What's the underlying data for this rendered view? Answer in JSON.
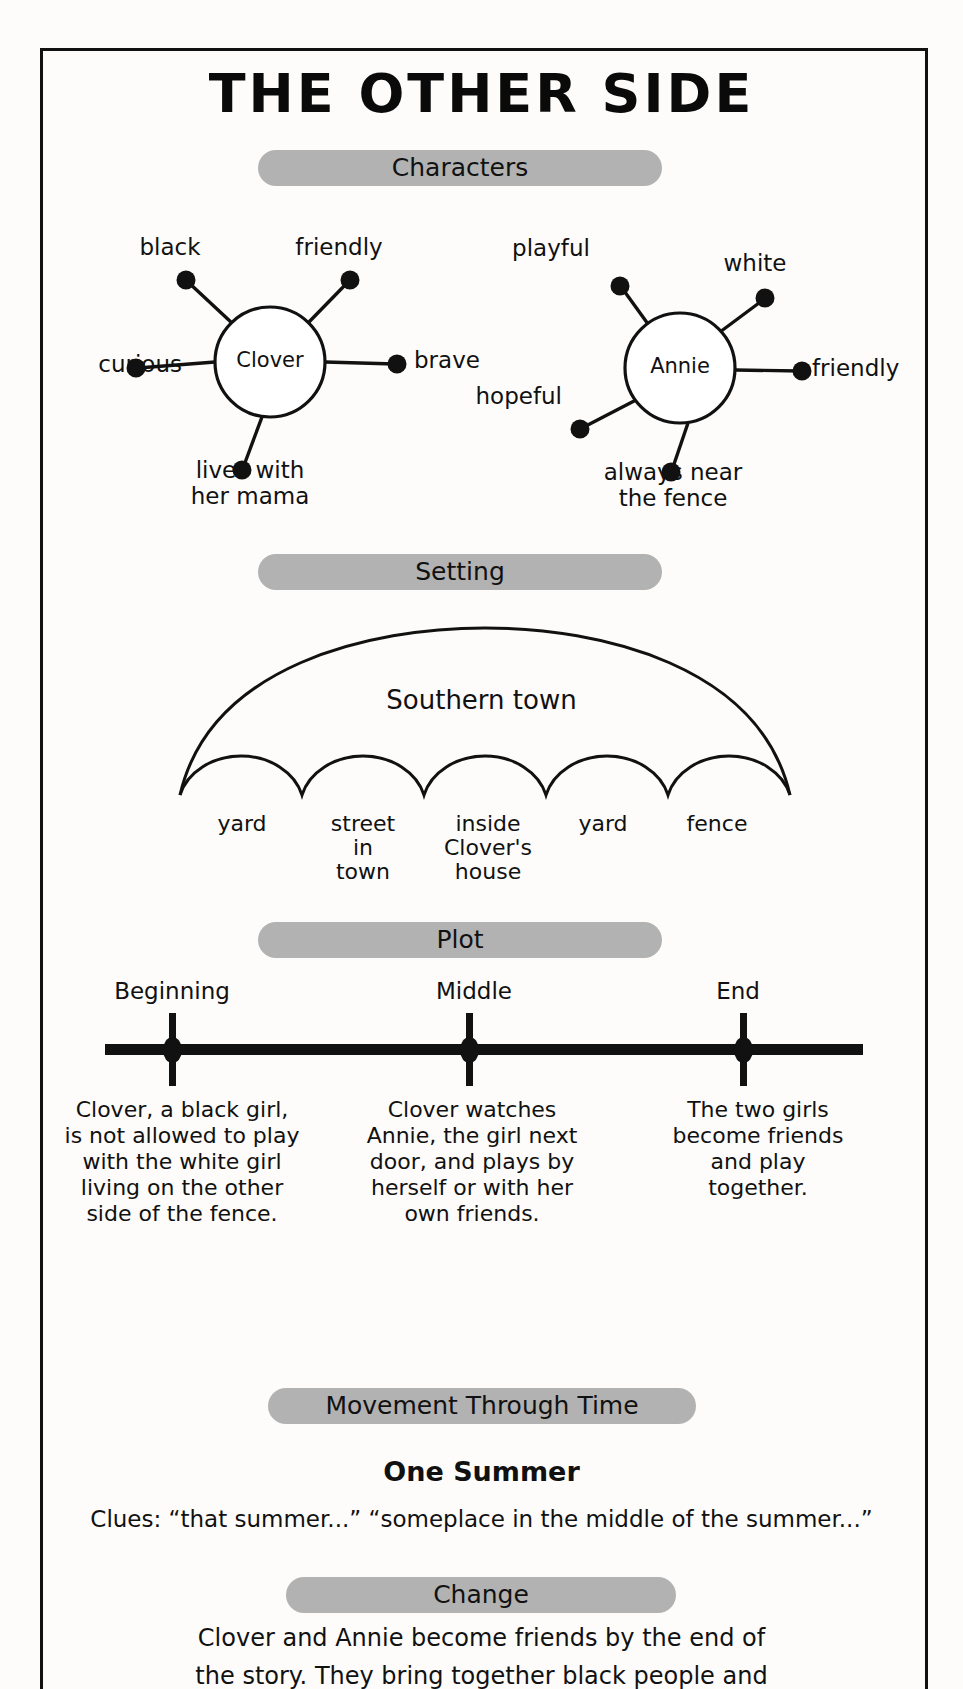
{
  "title": "THE OTHER SIDE",
  "sections": {
    "characters": {
      "banner": "Characters"
    },
    "setting": {
      "banner": "Setting"
    },
    "plot": {
      "banner": "Plot"
    },
    "movement": {
      "banner": "Movement Through Time"
    },
    "change": {
      "banner": "Change"
    }
  },
  "characters": [
    {
      "name": "Clover",
      "traits": [
        {
          "label": "black"
        },
        {
          "label": "friendly"
        },
        {
          "label": "curious"
        },
        {
          "label": "brave"
        },
        {
          "label": "lives with\nher mama"
        }
      ]
    },
    {
      "name": "Annie",
      "traits": [
        {
          "label": "playful"
        },
        {
          "label": "white"
        },
        {
          "label": "hopeful"
        },
        {
          "label": "friendly"
        },
        {
          "label": "always near\nthe fence"
        }
      ]
    }
  ],
  "setting": {
    "main": "Southern town",
    "places": [
      "yard",
      "street\nin\ntown",
      "inside\nClover's\nhouse",
      "yard",
      "fence"
    ]
  },
  "plot": {
    "stages": [
      {
        "label": "Beginning",
        "description": "Clover, a black girl,\nis not allowed to play\nwith the white girl\nliving on the other\nside of the fence."
      },
      {
        "label": "Middle",
        "description": "Clover watches\nAnnie, the girl next\ndoor, and plays by\nherself or with her\nown friends."
      },
      {
        "label": "End",
        "description": "The two girls\nbecome friends\nand play\ntogether."
      }
    ]
  },
  "movement_through_time": {
    "heading": "One Summer",
    "clues": "Clues: “that summer...” “someplace in the middle of the summer...”"
  },
  "change": {
    "body": "Clover and Annie become friends by the end of\nthe story. They bring together black people and"
  },
  "colors": {
    "banner_gray": "#b2b2b2",
    "ink": "#111111",
    "paper": "#fdfcfa"
  }
}
